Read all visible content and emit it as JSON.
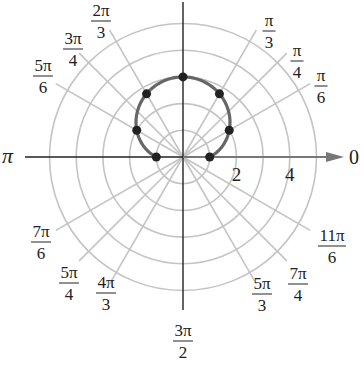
{
  "chart_data": {
    "type": "polar",
    "title": "",
    "equation": "r = 1 + 2 sin θ",
    "center_px": [
      183,
      157
    ],
    "unit_px": 26.7,
    "radial_circles": [
      1,
      2,
      3,
      4,
      5
    ],
    "radial_tick_labels": [
      "2",
      "4"
    ],
    "angle_labels": [
      {
        "num": "π",
        "den": "6",
        "angle_deg": 30
      },
      {
        "num": "π",
        "den": "4",
        "angle_deg": 45
      },
      {
        "num": "π",
        "den": "3",
        "angle_deg": 60
      },
      {
        "num": "2π",
        "den": "3",
        "angle_deg": 120
      },
      {
        "num": "3π",
        "den": "4",
        "angle_deg": 135
      },
      {
        "num": "5π",
        "den": "6",
        "angle_deg": 150
      },
      {
        "num": "7π",
        "den": "6",
        "angle_deg": 210
      },
      {
        "num": "5π",
        "den": "4",
        "angle_deg": 225
      },
      {
        "num": "4π",
        "den": "3",
        "angle_deg": 240
      },
      {
        "num": "3π",
        "den": "2",
        "angle_deg": 270
      },
      {
        "num": "5π",
        "den": "3",
        "angle_deg": 300
      },
      {
        "num": "7π",
        "den": "4",
        "angle_deg": 315
      },
      {
        "num": "11π",
        "den": "6",
        "angle_deg": 330
      }
    ],
    "axis_labels": {
      "zero": "0",
      "pi": "π"
    },
    "points": [
      {
        "theta": "0",
        "r": 1
      },
      {
        "theta": "π/6",
        "r": 2
      },
      {
        "theta": "π/3",
        "r": 2.73
      },
      {
        "theta": "π/2",
        "r": 3
      },
      {
        "theta": "2π/3",
        "r": 2.73
      },
      {
        "theta": "5π/6",
        "r": 2
      },
      {
        "theta": "π",
        "r": 1
      }
    ],
    "colors": {
      "grid": "#c4c4c4",
      "curve": "#666666",
      "points": "#222222",
      "axis": "#222222",
      "polar_axis": "#777777"
    }
  }
}
